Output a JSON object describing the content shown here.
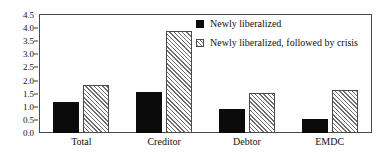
{
  "chart_data": {
    "type": "bar",
    "title": "",
    "xlabel": "",
    "ylabel": "",
    "categories": [
      "Total",
      "Creditor",
      "Debtor",
      "EMDC"
    ],
    "series": [
      {
        "name": "Newly liberalized",
        "swatch": "solid-black",
        "color": "#0b0b0b",
        "values": [
          1.18,
          1.57,
          0.91,
          0.55
        ]
      },
      {
        "name": "Newly liberalized, followed by crisis",
        "swatch": "diagonal-hatch",
        "color": "#6e6e6e",
        "values": [
          1.84,
          3.88,
          1.51,
          1.65
        ]
      }
    ],
    "ylim": [
      0.0,
      4.5
    ],
    "ytick_values": [
      0.0,
      0.5,
      1.0,
      1.5,
      2.0,
      2.5,
      3.0,
      3.5,
      4.0,
      4.5
    ],
    "ytick_labels": [
      "0.0",
      "0.5",
      "1.0",
      "1.5",
      "2.0",
      "2.5",
      "3.0",
      "3.5",
      "4.0",
      "4.5"
    ],
    "grid": false,
    "legend_position": "inside-top-right"
  },
  "legend": {
    "entries": [
      {
        "label": "Newly liberalized"
      },
      {
        "label": "Newly liberalized, followed by crisis"
      }
    ]
  }
}
